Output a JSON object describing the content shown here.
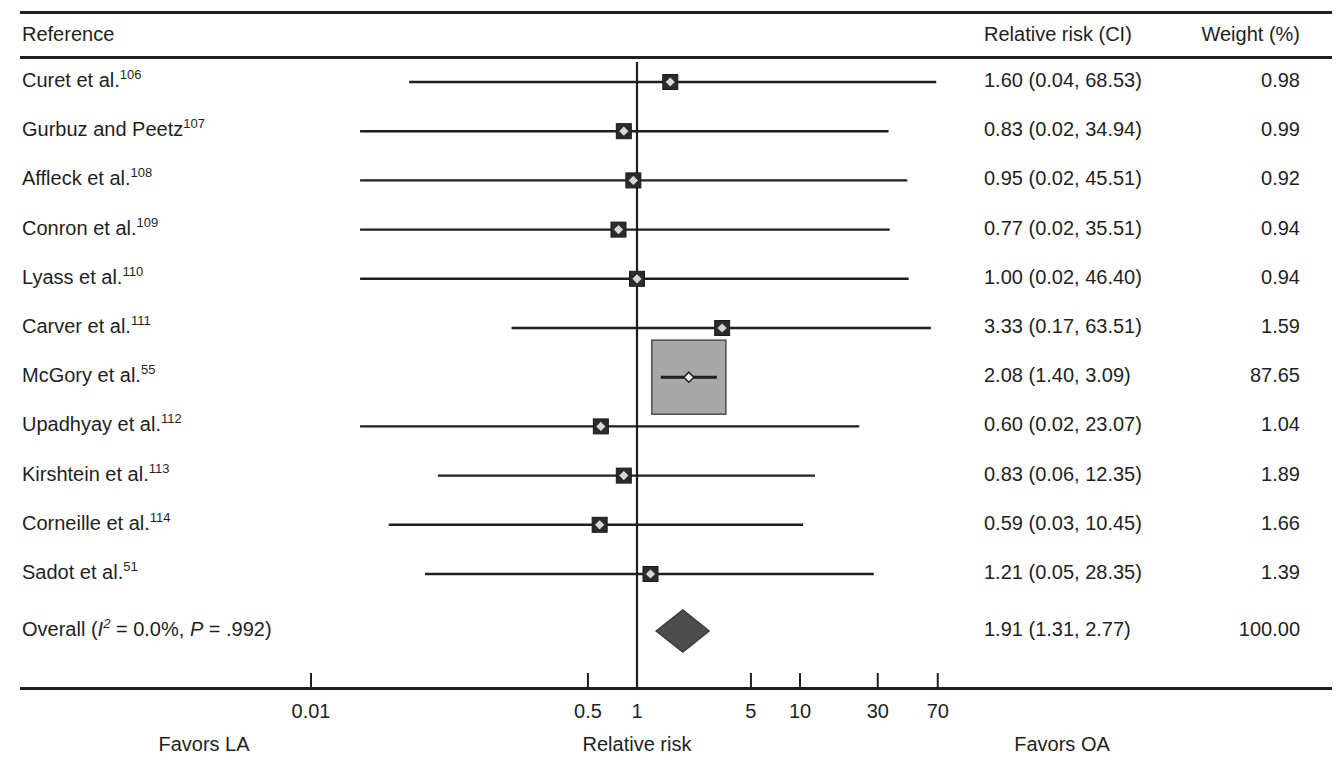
{
  "figure": {
    "type": "forest-plot",
    "columns": {
      "reference": "Reference",
      "estimate": "Relative risk (CI)",
      "weight": "Weight (%)"
    },
    "axis": {
      "title": "Relative risk",
      "scale": "log",
      "ticks": [
        0.01,
        0.5,
        1,
        5,
        10,
        30,
        70
      ],
      "tick_labels": [
        "0.01",
        "0.5",
        "1",
        "5",
        "10",
        "30",
        "70"
      ],
      "null_value": 1,
      "left_footer": "Favors LA",
      "right_footer": "Favors OA"
    },
    "overall_label_parts": {
      "prefix": "Overall (",
      "i_symbol": "I",
      "i_exponent": "2",
      "heterogeneity": " = 0.0%, ",
      "p_symbol": "P",
      "p_value": " = .992)"
    }
  },
  "chart_data": {
    "type": "forest",
    "title": "",
    "xlabel": "Relative risk",
    "ylabel": "",
    "xscale": "log",
    "xlim": [
      0.004,
      200
    ],
    "xticks": [
      0.01,
      0.5,
      1,
      5,
      10,
      30,
      70
    ],
    "null_line": 1,
    "grid": false,
    "legend": "none",
    "columns": [
      "Reference",
      "Relative risk (CI)",
      "Weight (%)"
    ],
    "studies": [
      {
        "label": "Curet et al.",
        "ref": "106",
        "rr": 1.6,
        "lcl": 0.04,
        "ucl": 68.53,
        "estimate_text": "1.60 (0.04, 68.53)",
        "weight": 0.98,
        "weight_text": "0.98"
      },
      {
        "label": "Gurbuz and Peetz",
        "ref": "107",
        "rr": 0.83,
        "lcl": 0.02,
        "ucl": 34.94,
        "estimate_text": "0.83 (0.02, 34.94)",
        "weight": 0.99,
        "weight_text": "0.99"
      },
      {
        "label": "Affleck et al.",
        "ref": "108",
        "rr": 0.95,
        "lcl": 0.02,
        "ucl": 45.51,
        "estimate_text": "0.95 (0.02, 45.51)",
        "weight": 0.92,
        "weight_text": "0.92"
      },
      {
        "label": "Conron et al.",
        "ref": "109",
        "rr": 0.77,
        "lcl": 0.02,
        "ucl": 35.51,
        "estimate_text": "0.77 (0.02, 35.51)",
        "weight": 0.94,
        "weight_text": "0.94"
      },
      {
        "label": "Lyass et al.",
        "ref": "110",
        "rr": 1.0,
        "lcl": 0.02,
        "ucl": 46.4,
        "estimate_text": "1.00 (0.02, 46.40)",
        "weight": 0.94,
        "weight_text": "0.94"
      },
      {
        "label": "Carver et al.",
        "ref": "111",
        "rr": 3.33,
        "lcl": 0.17,
        "ucl": 63.51,
        "estimate_text": "3.33 (0.17, 63.51)",
        "weight": 1.59,
        "weight_text": "1.59"
      },
      {
        "label": "McGory et al.",
        "ref": "55",
        "rr": 2.08,
        "lcl": 1.4,
        "ucl": 3.09,
        "estimate_text": "2.08 (1.40, 3.09)",
        "weight": 87.65,
        "weight_text": "87.65"
      },
      {
        "label": "Upadhyay et al.",
        "ref": "112",
        "rr": 0.6,
        "lcl": 0.02,
        "ucl": 23.07,
        "estimate_text": "0.60 (0.02, 23.07)",
        "weight": 1.04,
        "weight_text": "1.04"
      },
      {
        "label": "Kirshtein et al.",
        "ref": "113",
        "rr": 0.83,
        "lcl": 0.06,
        "ucl": 12.35,
        "estimate_text": "0.83 (0.06, 12.35)",
        "weight": 1.89,
        "weight_text": "1.89"
      },
      {
        "label": "Corneille et al.",
        "ref": "114",
        "rr": 0.59,
        "lcl": 0.03,
        "ucl": 10.45,
        "estimate_text": "0.59 (0.03, 10.45)",
        "weight": 1.66,
        "weight_text": "1.66"
      },
      {
        "label": "Sadot et al.",
        "ref": "51",
        "rr": 1.21,
        "lcl": 0.05,
        "ucl": 28.35,
        "estimate_text": "1.21 (0.05, 28.35)",
        "weight": 1.39,
        "weight_text": "1.39"
      }
    ],
    "overall": {
      "label": "Overall (I2 = 0.0%, P = .992)",
      "rr": 1.91,
      "lcl": 1.31,
      "ucl": 2.77,
      "estimate_text": "1.91 (1.31, 2.77)",
      "weight": 100.0,
      "weight_text": "100.00",
      "heterogeneity_i2": "0.0%",
      "heterogeneity_p": ".992"
    }
  },
  "colors": {
    "ink": "#1f1f1f",
    "box_fill": "#a8a8a8",
    "box_edge": "#555555",
    "diamond_fill": "#4d4d4d",
    "background": "#ffffff"
  }
}
